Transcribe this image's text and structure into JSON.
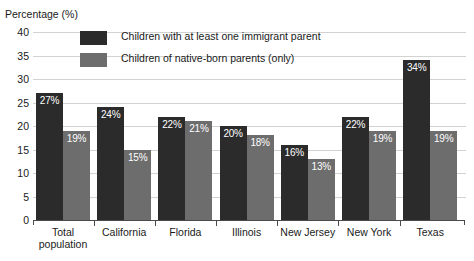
{
  "chart_data": {
    "type": "bar",
    "title": "",
    "subtitle": "",
    "ylabel": "Percentage (%)",
    "xlabel": "",
    "ylim": [
      0,
      40
    ],
    "yticks": [
      0,
      5,
      10,
      15,
      20,
      25,
      30,
      35,
      40
    ],
    "grid": true,
    "legend_position": "top-left-inside",
    "categories": [
      "Total population",
      "California",
      "Florida",
      "Illinois",
      "New Jersey",
      "New York",
      "Texas"
    ],
    "category_lines": [
      [
        "Total",
        "population"
      ],
      [
        "California"
      ],
      [
        "Florida"
      ],
      [
        "Illinois"
      ],
      [
        "New Jersey"
      ],
      [
        "New York"
      ],
      [
        "Texas"
      ]
    ],
    "series": [
      {
        "name": "Children with at least one immigrant parent",
        "color": "#2b2b2b",
        "values": [
          27,
          24,
          22,
          20,
          16,
          22,
          34
        ],
        "labels": [
          "27%",
          "24%",
          "22%",
          "20%",
          "16%",
          "22%",
          "34%"
        ]
      },
      {
        "name": "Children of native-born parents (only)",
        "color": "#6d6d6d",
        "values": [
          19,
          15,
          21,
          18,
          13,
          19,
          19
        ],
        "labels": [
          "19%",
          "15%",
          "21%",
          "18%",
          "13%",
          "19%",
          "19%"
        ]
      }
    ],
    "ytick_labels": [
      "0",
      "5",
      "10",
      "15",
      "20",
      "25",
      "30",
      "35",
      "40"
    ],
    "axis_color": "#4a4a4a",
    "grid_color": "#d2d2d2",
    "background": "#ffffff"
  }
}
